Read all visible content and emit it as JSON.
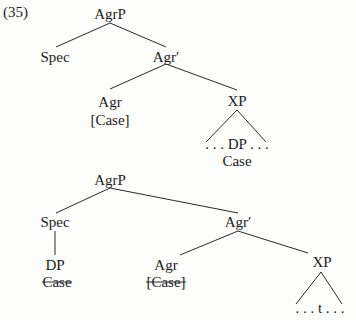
{
  "example_number": "(35)",
  "tree1": {
    "root": "AgrP",
    "spec": "Spec",
    "bar": "Agr′",
    "head": "Agr",
    "head_feature": "[Case]",
    "complement": "XP",
    "complement_content": ". . . DP . . .",
    "complement_feature": "Case"
  },
  "tree2": {
    "root": "AgrP",
    "spec": "Spec",
    "spec_child": "DP",
    "spec_child_feature": "Case",
    "bar": "Agr′",
    "head": "Agr",
    "head_feature": "[Case]",
    "complement": "XP",
    "complement_content": ". . . t . . ."
  }
}
